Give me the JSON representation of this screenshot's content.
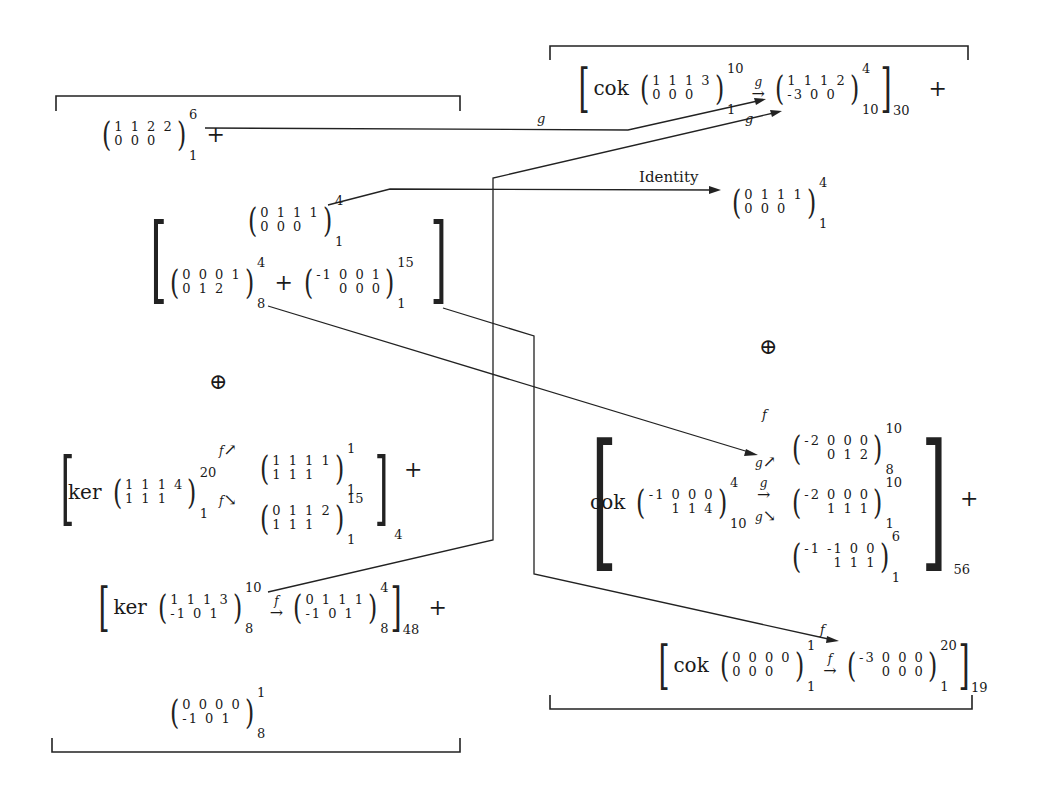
{
  "diagram": {
    "left_brace": {
      "top_term": {
        "matrix": {
          "row1": "1 1 2 2",
          "row2": "0 0 0",
          "sup": "6",
          "sub": "1"
        },
        "trailing_op": "+"
      },
      "bracket_group": {
        "top": {
          "row1": "0 1 1 1",
          "row2": "0 0 0",
          "sup": "4",
          "sub": "1"
        },
        "bottom_left": {
          "row1": "0 0 0 1",
          "row2": "0 1 2",
          "sup": "4",
          "sub": "8"
        },
        "op": "+",
        "bottom_right": {
          "row1": "-1 0 0 1",
          "row2": "0 0 0",
          "sup": "15",
          "sub": "1"
        }
      },
      "oplus": "⊕",
      "ker_group": {
        "word": "ker",
        "source": {
          "row1": "1 1 1 4",
          "row2": "1 1 1",
          "sup": "20",
          "sub": "1"
        },
        "upper_arrow": {
          "label": "f",
          "symbol": "↗"
        },
        "lower_arrow": {
          "label": "f",
          "symbol": "↘"
        },
        "target_upper": {
          "row1": "1 1 1 1",
          "row2": "1 1 1",
          "sup": "1",
          "sub": "1"
        },
        "target_lower": {
          "row1": "0 1 1 2",
          "row2": "1 1 1",
          "sup": "15",
          "sub": "1"
        },
        "subscript": "4",
        "trailing_op": "+"
      },
      "ker_group_2": {
        "word": "ker",
        "source": {
          "row1": "1 1 1 3",
          "row2": "-1 0 1",
          "sup": "10",
          "sub": "8"
        },
        "arrow": {
          "label": "f",
          "symbol": "→"
        },
        "target": {
          "row1": "0 1 1 1",
          "row2": "-1 0 1",
          "sup": "4",
          "sub": "8"
        },
        "subscript": "48",
        "trailing_op": "+"
      },
      "bottom_term": {
        "row1": "0 0 0 0",
        "row2": "-1 0 1",
        "sup": "1",
        "sub": "8"
      }
    },
    "right_brace": {
      "cok_group_top": {
        "word": "cok",
        "source": {
          "row1": "1 1 1 3",
          "row2": "0 0 0",
          "sup": "10",
          "sub": "1"
        },
        "arrow": {
          "label": "g",
          "symbol": "→"
        },
        "target": {
          "row1": "1 1 1 2",
          "row2": "-3 0 0",
          "sup": "4",
          "sub": "10"
        },
        "subscript": "30",
        "trailing_op": "+"
      },
      "identity_target": {
        "row1": "0 1 1 1",
        "row2": "0 0 0",
        "sup": "4",
        "sub": "1"
      },
      "oplus": "⊕",
      "cok_group_mid": {
        "word": "cok",
        "source": {
          "row1": "-1 0 0 0",
          "row2": "1 1 4",
          "sup": "4",
          "sub": "10"
        },
        "arrows": [
          {
            "label": "g",
            "symbol": "↗"
          },
          {
            "label": "g",
            "symbol": "→"
          },
          {
            "label": "g",
            "symbol": "↘"
          }
        ],
        "targets": [
          {
            "row1": "-2 0 0 0",
            "row2": "0 1 2",
            "sup": "10",
            "sub": "8"
          },
          {
            "row1": "-2 0 0 0",
            "row2": "1 1 1",
            "sup": "10",
            "sub": "1"
          },
          {
            "row1": "-1 -1 0 0",
            "row2": "1 1 1",
            "sup": "6",
            "sub": "1"
          }
        ],
        "subscript": "56",
        "trailing_op": "+"
      },
      "cok_group_bottom": {
        "word": "cok",
        "source": {
          "row1": "0 0 0 0",
          "row2": "0 0 0",
          "sup": "1",
          "sub": "1"
        },
        "arrow": {
          "label": "f",
          "symbol": "→"
        },
        "target": {
          "row1": "-3 0 0 0",
          "row2": "0 0 0",
          "sup": "20",
          "sub": "1"
        },
        "subscript": "19"
      }
    },
    "connectors": [
      {
        "from": "left.top_term",
        "to": "right.cok_group_top.target",
        "label": "g"
      },
      {
        "from": "left.ker_group_2",
        "to": "right.cok_group_top.target",
        "label": "g"
      },
      {
        "from": "left.bracket_group.top",
        "to": "right.identity_target",
        "label": "Identity"
      },
      {
        "from": "left.bracket_group.bottom_left",
        "to": "right.cok_group_mid.targets.0",
        "label": "f"
      },
      {
        "from": "left.bracket_group.bottom_right",
        "to": "right.cok_group_bottom.target",
        "label": "f"
      }
    ]
  }
}
